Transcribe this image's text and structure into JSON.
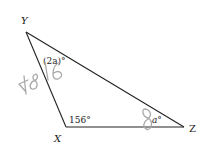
{
  "diagram": {
    "type": "triangle",
    "vertices": [
      {
        "name": "Y",
        "label": "Y",
        "angle_label": "(2a)°"
      },
      {
        "name": "X",
        "label": "X",
        "angle_label": "156°"
      },
      {
        "name": "Z",
        "label": "Z",
        "angle_label": "a°"
      }
    ],
    "handwritten_annotations": [
      "48",
      "16",
      "8"
    ]
  },
  "colors": {
    "lines": "#222222",
    "handwriting": "#a9a9a9"
  }
}
